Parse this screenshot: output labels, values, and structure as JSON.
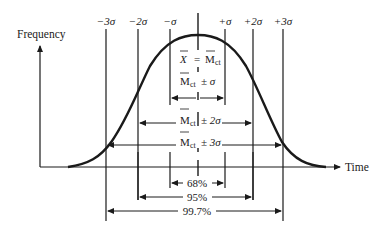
{
  "diagram": {
    "type": "normal-distribution",
    "y_axis_label": "Frequency",
    "x_axis_label": "Time",
    "sigma_labels": [
      "−3σ",
      "−2σ",
      "−σ",
      "+σ",
      "+2σ",
      "+3σ"
    ],
    "mean_label": "X̄ = M̄ct",
    "mean_label_parts": {
      "x": "X",
      "eq": "=",
      "m": "M",
      "sub": "ct"
    },
    "ranges": [
      {
        "m": "M",
        "sub": "ct",
        "pm": "± σ"
      },
      {
        "m": "M",
        "sub": "ct",
        "pm": "± 2σ"
      },
      {
        "m": "M",
        "sub": "ct",
        "pm": "± 3σ"
      }
    ],
    "percentages": [
      "68%",
      "95%",
      "99.7%"
    ],
    "colors": {
      "ink": "#1a1a1a",
      "background": "#ffffff"
    }
  }
}
